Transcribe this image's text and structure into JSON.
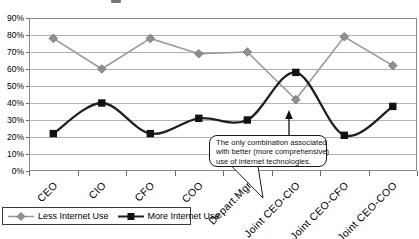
{
  "chart_data": {
    "type": "line",
    "categories": [
      "CEO",
      "CIO",
      "CFO",
      "COO",
      "Depart.Mgr",
      "Joint CEO-CIO",
      "Joint CEO-CFO",
      "Joint CEO-COO"
    ],
    "series": [
      {
        "name": "Less Internet Use",
        "marker": "diamond",
        "color": "#9a9a9a",
        "smooth": false,
        "values": [
          78,
          60,
          78,
          69,
          70,
          42,
          79,
          62
        ]
      },
      {
        "name": "More Internet Use",
        "marker": "square",
        "color": "#1f1f1f",
        "smooth": true,
        "values": [
          22,
          40,
          22,
          31,
          30,
          58,
          21,
          38
        ]
      }
    ],
    "title": "",
    "xlabel": "",
    "ylabel": "",
    "ylim": [
      0,
      90
    ],
    "y_ticks": [
      "0%",
      "10%",
      "20%",
      "30%",
      "40%",
      "50%",
      "60%",
      "70%",
      "80%",
      "90%"
    ],
    "grid": true,
    "legend_position": "bottom-left",
    "colors": {
      "gridline": "#b2b2b2",
      "plot_border": "#8a8a8a",
      "tick": "#6b6b6b"
    }
  },
  "annotation": {
    "lines": [
      "The only combination associated",
      "with better (more comprehensive)",
      "use of internet technologies."
    ],
    "target_category": "Joint CEO-CIO"
  }
}
